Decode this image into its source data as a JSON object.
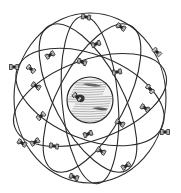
{
  "diagram": {
    "colors": {
      "line": "#2a2a2a",
      "background": "#ffffff",
      "earth_fill": "#f2f2f2"
    },
    "earth": {
      "cx": 90,
      "cy": 100,
      "r": 23
    },
    "orbits": [
      {
        "cx": 90,
        "cy": 97,
        "rx": 78,
        "ry": 42,
        "rot": 22
      },
      {
        "cx": 90,
        "cy": 100,
        "rx": 80,
        "ry": 40,
        "rot": -20
      },
      {
        "cx": 88,
        "cy": 98,
        "rx": 82,
        "ry": 34,
        "rot": 62
      },
      {
        "cx": 92,
        "cy": 98,
        "rx": 82,
        "ry": 34,
        "rot": -62
      },
      {
        "cx": 90,
        "cy": 98,
        "rx": 76,
        "ry": 85,
        "rot": 0
      },
      {
        "cx": 90,
        "cy": 100,
        "rx": 84,
        "ry": 28,
        "rot": 85
      }
    ],
    "satellites": [
      {
        "x": 86,
        "y": 17,
        "a": 10
      },
      {
        "x": 121,
        "y": 27,
        "a": 30
      },
      {
        "x": 96,
        "y": 44,
        "a": -20
      },
      {
        "x": 157,
        "y": 52,
        "a": 45
      },
      {
        "x": 50,
        "y": 55,
        "a": -30
      },
      {
        "x": 82,
        "y": 62,
        "a": 20
      },
      {
        "x": 14,
        "y": 67,
        "a": 0
      },
      {
        "x": 31,
        "y": 69,
        "a": 40
      },
      {
        "x": 117,
        "y": 72,
        "a": -10
      },
      {
        "x": 36,
        "y": 86,
        "a": 30
      },
      {
        "x": 150,
        "y": 89,
        "a": 50
      },
      {
        "x": 77,
        "y": 97,
        "a": 40
      },
      {
        "x": 145,
        "y": 108,
        "a": 30
      },
      {
        "x": 41,
        "y": 116,
        "a": -40
      },
      {
        "x": 120,
        "y": 123,
        "a": 30
      },
      {
        "x": 165,
        "y": 132,
        "a": 0
      },
      {
        "x": 88,
        "y": 134,
        "a": -20
      },
      {
        "x": 22,
        "y": 143,
        "a": 30
      },
      {
        "x": 35,
        "y": 142,
        "a": -30
      },
      {
        "x": 54,
        "y": 146,
        "a": 10
      },
      {
        "x": 101,
        "y": 151,
        "a": 30
      },
      {
        "x": 126,
        "y": 166,
        "a": -30
      },
      {
        "x": 74,
        "y": 177,
        "a": 20
      }
    ]
  }
}
